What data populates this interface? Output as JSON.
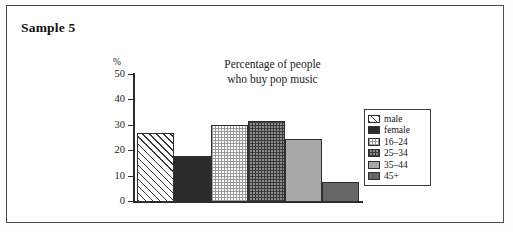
{
  "page": {
    "title": "Sample 5"
  },
  "chart_data": {
    "type": "bar",
    "title": "Percentage of people who buy pop music",
    "title_lines": [
      "Percentage of people",
      "who buy pop music"
    ],
    "xlabel": "",
    "ylabel": "%",
    "ylim": [
      0,
      50
    ],
    "yticks": [
      50,
      40,
      30,
      20,
      10,
      0
    ],
    "grid": false,
    "legend_position": "right",
    "categories": [
      "male",
      "female",
      "16–24",
      "25–34",
      "35–44",
      "45+"
    ],
    "values": [
      27,
      18,
      30.5,
      32,
      25,
      8
    ],
    "fills": [
      "diagonal-hatch",
      "dark-solid",
      "fine-dotted",
      "cross-hatch",
      "medium-gray",
      "dark-gray"
    ]
  },
  "legend": {
    "items": [
      {
        "label": "male",
        "fill": "diagonal-hatch"
      },
      {
        "label": "female",
        "fill": "dark-solid"
      },
      {
        "label": "16–24",
        "fill": "fine-dotted"
      },
      {
        "label": "25–34",
        "fill": "cross-hatch"
      },
      {
        "label": "35–44",
        "fill": "medium-gray"
      },
      {
        "label": "45+",
        "fill": "dark-gray"
      }
    ]
  }
}
